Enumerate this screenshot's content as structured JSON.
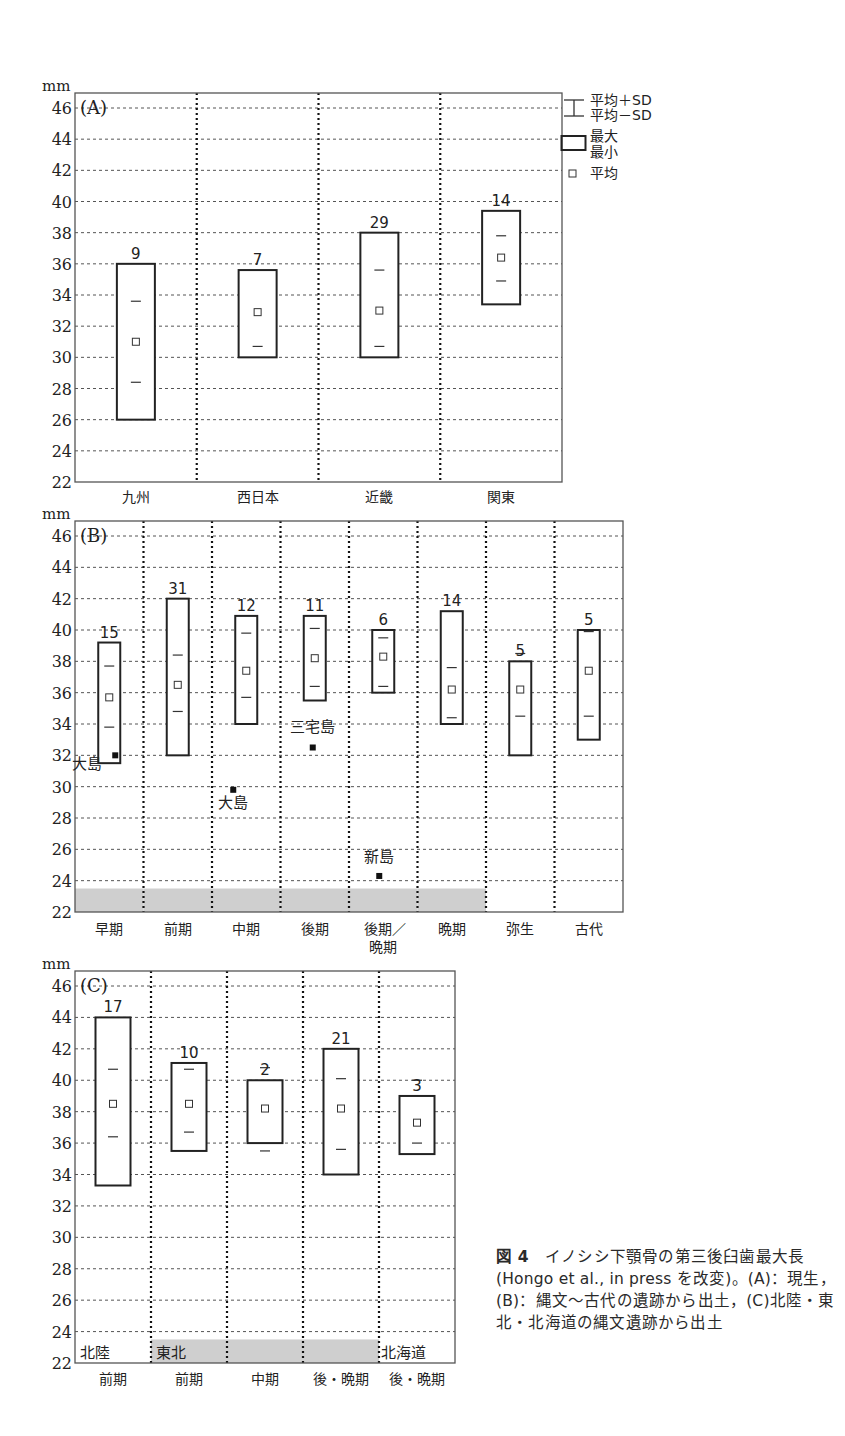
{
  "figure": {
    "unit_label": "mm",
    "caption": {
      "fig_no": "図 4",
      "text": "イノシシ下顎骨の第三後臼歯最大長(Hongo et al., in press を改変)。(A)：現生，(B)：縄文〜古代の遺跡から出土，(C)北陸・東北・北海道の縄文遺跡から出土"
    },
    "legend": {
      "sd_plus": "平均＋SD",
      "sd_minus": "平均－SD",
      "max": "最大",
      "min": "最小",
      "mean": "平均"
    }
  },
  "chart_data": [
    {
      "type": "box",
      "panel": "(A)",
      "ylabel": "mm",
      "ylim": [
        22,
        47
      ],
      "yticks": [
        22,
        24,
        26,
        28,
        30,
        32,
        34,
        36,
        38,
        40,
        42,
        44,
        46
      ],
      "categories": [
        "九州",
        "西日本",
        "近畿",
        "関東"
      ],
      "n": [
        9,
        7,
        29,
        14
      ],
      "max": [
        36.0,
        35.6,
        38.0,
        39.4
      ],
      "min": [
        26.0,
        30.0,
        30.0,
        33.4
      ],
      "mean": [
        31.0,
        32.9,
        33.0,
        36.4
      ],
      "sd_plus": [
        33.6,
        null,
        35.6,
        37.8
      ],
      "sd_minus": [
        28.4,
        30.7,
        30.7,
        34.9
      ],
      "outliers": []
    },
    {
      "type": "box",
      "panel": "(B)",
      "ylabel": "mm",
      "ylim": [
        22,
        47
      ],
      "yticks": [
        22,
        24,
        26,
        28,
        30,
        32,
        34,
        36,
        38,
        40,
        42,
        44,
        46
      ],
      "categories": [
        "早期",
        "前期",
        "中期",
        "後期",
        "後期／晩期",
        "晩期",
        "弥生",
        "古代"
      ],
      "n": [
        15,
        31,
        12,
        11,
        6,
        14,
        5,
        5
      ],
      "max": [
        39.2,
        42.0,
        40.9,
        40.9,
        40.0,
        41.2,
        38.0,
        40.0
      ],
      "min": [
        31.5,
        32.0,
        34.0,
        35.5,
        36.0,
        34.0,
        32.0,
        33.0
      ],
      "mean": [
        35.7,
        36.5,
        37.4,
        38.2,
        38.3,
        36.2,
        36.2,
        37.4
      ],
      "sd_plus": [
        37.7,
        38.4,
        39.8,
        40.1,
        39.5,
        37.6,
        38.5,
        39.9
      ],
      "sd_minus": [
        33.8,
        34.8,
        35.7,
        36.4,
        36.4,
        34.4,
        34.5,
        34.5
      ],
      "shaded_categories": [
        "早期",
        "前期",
        "中期",
        "後期",
        "後期／晩期",
        "晩期"
      ],
      "outliers": [
        {
          "category": "早期",
          "value": 32.0,
          "label": "大島"
        },
        {
          "category": "中期",
          "value": 29.8,
          "label": "大島"
        },
        {
          "category": "後期",
          "value": 32.5,
          "label": "三宅島"
        },
        {
          "category": "後期／晩期",
          "value": 24.3,
          "label": "新島"
        }
      ]
    },
    {
      "type": "box",
      "panel": "(C)",
      "ylabel": "mm",
      "ylim": [
        22,
        47
      ],
      "yticks": [
        22,
        24,
        26,
        28,
        30,
        32,
        34,
        36,
        38,
        40,
        42,
        44,
        46
      ],
      "categories": [
        "前期",
        "前期",
        "中期",
        "後・晩期",
        "後・晩期"
      ],
      "regions": [
        "北陸",
        "東北",
        "東北",
        "東北",
        "北海道"
      ],
      "region_labels": [
        "北陸",
        "東北",
        "北海道"
      ],
      "n": [
        17,
        10,
        2,
        21,
        3
      ],
      "max": [
        44.0,
        41.1,
        40.0,
        42.0,
        39.0
      ],
      "min": [
        33.3,
        35.5,
        36.0,
        34.0,
        35.3
      ],
      "mean": [
        38.5,
        38.5,
        38.2,
        38.2,
        37.3
      ],
      "sd_plus": [
        40.7,
        40.7,
        40.8,
        40.1,
        40.0
      ],
      "sd_minus": [
        36.4,
        36.7,
        35.5,
        35.6,
        36.0
      ],
      "shaded_categories_index": [
        1,
        2,
        3
      ],
      "outliers": []
    }
  ]
}
